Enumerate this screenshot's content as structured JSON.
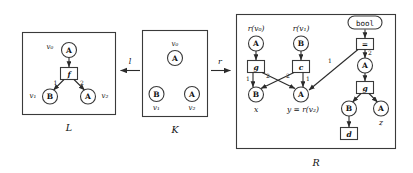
{
  "figure": {
    "frames": [
      {
        "id": "L",
        "label": "L"
      },
      {
        "id": "K",
        "label": "K"
      },
      {
        "id": "R",
        "label": "R"
      }
    ],
    "morphisms": [
      {
        "id": "l",
        "label": "l",
        "direction": "left"
      },
      {
        "id": "r",
        "label": "r",
        "direction": "right"
      }
    ]
  },
  "L": {
    "caption": "L",
    "nodes": [
      {
        "id": "L-A-top",
        "label": "A",
        "shape": "circle"
      },
      {
        "id": "L-B",
        "label": "B",
        "shape": "circle"
      },
      {
        "id": "L-A-right",
        "label": "A",
        "shape": "circle"
      }
    ],
    "opboxes": [
      {
        "id": "L-f",
        "label": "f",
        "shape": "box"
      }
    ],
    "vertex_labels": [
      {
        "id": "L-v0",
        "label": "v₀"
      },
      {
        "id": "L-v1",
        "label": "v₁"
      },
      {
        "id": "L-v2",
        "label": "v₂"
      }
    ],
    "edge_labels": [
      {
        "id": "L-e1",
        "label": "1"
      },
      {
        "id": "L-e2",
        "label": "2"
      }
    ]
  },
  "K": {
    "caption": "K",
    "nodes": [
      {
        "id": "K-A-top",
        "label": "A",
        "shape": "circle"
      },
      {
        "id": "K-B",
        "label": "B",
        "shape": "circle"
      },
      {
        "id": "K-A-right",
        "label": "A",
        "shape": "circle"
      }
    ],
    "vertex_labels": [
      {
        "id": "K-v0",
        "label": "v₀"
      },
      {
        "id": "K-v1",
        "label": "v₁"
      },
      {
        "id": "K-v2",
        "label": "v₂"
      }
    ]
  },
  "R": {
    "caption": "R",
    "nodes": [
      {
        "id": "R-A1",
        "label": "A",
        "shape": "circle"
      },
      {
        "id": "R-B1",
        "label": "B",
        "shape": "circle"
      },
      {
        "id": "R-B-x",
        "label": "B",
        "shape": "circle"
      },
      {
        "id": "R-A-y",
        "label": "A",
        "shape": "circle"
      },
      {
        "id": "R-A-mid",
        "label": "A",
        "shape": "circle"
      },
      {
        "id": "R-B-low",
        "label": "B",
        "shape": "circle"
      },
      {
        "id": "R-A-z",
        "label": "A",
        "shape": "circle"
      }
    ],
    "opboxes": [
      {
        "id": "R-g",
        "label": "g",
        "shape": "box"
      },
      {
        "id": "R-c",
        "label": "c",
        "shape": "box"
      },
      {
        "id": "R-eq",
        "label": "=",
        "shape": "box"
      },
      {
        "id": "R-g2",
        "label": "g",
        "shape": "box"
      },
      {
        "id": "R-d",
        "label": "d",
        "shape": "box"
      }
    ],
    "type_node": {
      "id": "R-bool",
      "label": "bool",
      "shape": "rounded"
    },
    "annotations": [
      {
        "id": "R-rv0",
        "label": "r(v₀)"
      },
      {
        "id": "R-rv1",
        "label": "r(v₁)"
      },
      {
        "id": "R-x",
        "label": "x"
      },
      {
        "id": "R-y",
        "label": "y = r(v₂)"
      },
      {
        "id": "R-z",
        "label": "z"
      }
    ],
    "edge_labels": [
      {
        "id": "R-g-1",
        "label": "1"
      },
      {
        "id": "R-g-2",
        "label": "2"
      },
      {
        "id": "R-c-2",
        "label": "2"
      },
      {
        "id": "R-c-1",
        "label": "1"
      },
      {
        "id": "R-eq-1",
        "label": "1"
      },
      {
        "id": "R-eq-2",
        "label": "2"
      }
    ]
  },
  "colors": {
    "stroke": "#3a3a3a",
    "text": "#111111",
    "background": "#ffffff"
  }
}
